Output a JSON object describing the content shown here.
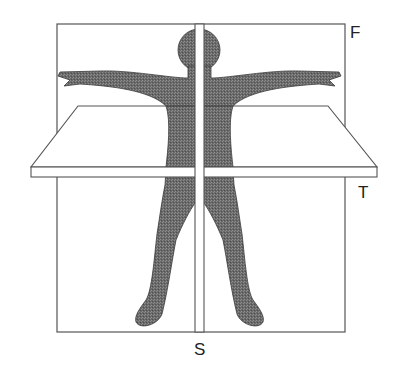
{
  "diagram": {
    "labels": {
      "frontal": "F",
      "transverse": "T",
      "sagittal": "S"
    },
    "colors": {
      "background": "#ffffff",
      "outline": "#555555",
      "figure_fill": "#6f6f6f",
      "figure_stroke": "#3a3a3a",
      "plane_fill": "#ffffff",
      "label": "#222222"
    },
    "planes": [
      {
        "id": "frontal",
        "label": "F",
        "description": "Frontal (coronal) plane - large vertical rectangle behind the figure"
      },
      {
        "id": "transverse",
        "label": "T",
        "description": "Transverse (horizontal) plane - slab cutting across the waist"
      },
      {
        "id": "sagittal",
        "label": "S",
        "description": "Sagittal plane - thin vertical slab through the midline"
      }
    ]
  }
}
